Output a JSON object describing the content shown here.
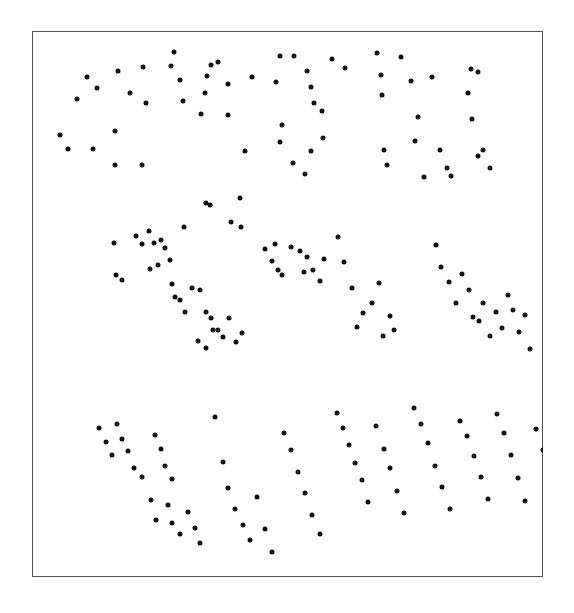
{
  "figure": {
    "background_color": "#ffffff",
    "frame": {
      "x": 32,
      "y": 31,
      "width": 511,
      "height": 546,
      "border_color": "#555555",
      "border_width": 1.5,
      "fill_color": "#ffffff"
    }
  },
  "chart_data": {
    "type": "scatter",
    "title": "",
    "subtitle": "",
    "xlabel": "",
    "ylabel": "",
    "grid": false,
    "legend": null,
    "axis_ticks": false,
    "tick_labels": [],
    "annotations": [],
    "xlim": [
      0,
      511
    ],
    "ylim": [
      0,
      546
    ],
    "y_axis_inverted": true,
    "marker": {
      "shape": "circle",
      "color": "#111111",
      "size_px": 5,
      "edge_color": "#111111"
    },
    "n_points": 192,
    "points": [
      [
        55,
        46
      ],
      [
        86,
        40
      ],
      [
        111,
        36
      ],
      [
        45,
        68
      ],
      [
        65,
        57
      ],
      [
        98,
        62
      ],
      [
        114,
        72
      ],
      [
        28,
        104
      ],
      [
        36,
        118
      ],
      [
        61,
        118
      ],
      [
        83,
        100
      ],
      [
        83,
        134
      ],
      [
        110,
        134
      ],
      [
        142,
        21
      ],
      [
        139,
        35
      ],
      [
        148,
        49
      ],
      [
        151,
        70
      ],
      [
        175,
        45
      ],
      [
        179,
        34
      ],
      [
        173,
        62
      ],
      [
        169,
        83
      ],
      [
        186,
        31
      ],
      [
        196,
        53
      ],
      [
        196,
        84
      ],
      [
        213,
        120
      ],
      [
        220,
        46
      ],
      [
        248,
        25
      ],
      [
        244,
        51
      ],
      [
        262,
        25
      ],
      [
        275,
        40
      ],
      [
        279,
        56
      ],
      [
        282,
        72
      ],
      [
        290,
        80
      ],
      [
        300,
        28
      ],
      [
        313,
        37
      ],
      [
        250,
        94
      ],
      [
        248,
        111
      ],
      [
        261,
        132
      ],
      [
        273,
        143
      ],
      [
        279,
        120
      ],
      [
        291,
        107
      ],
      [
        345,
        22
      ],
      [
        349,
        44
      ],
      [
        350,
        64
      ],
      [
        352,
        119
      ],
      [
        355,
        134
      ],
      [
        369,
        26
      ],
      [
        379,
        50
      ],
      [
        386,
        86
      ],
      [
        383,
        110
      ],
      [
        392,
        146
      ],
      [
        400,
        46
      ],
      [
        408,
        119
      ],
      [
        415,
        137
      ],
      [
        419,
        145
      ],
      [
        439,
        38
      ],
      [
        436,
        62
      ],
      [
        440,
        88
      ],
      [
        446,
        41
      ],
      [
        446,
        125
      ],
      [
        451,
        119
      ],
      [
        458,
        137
      ],
      [
        152,
        196
      ],
      [
        174,
        172
      ],
      [
        178,
        174
      ],
      [
        199,
        191
      ],
      [
        208,
        167
      ],
      [
        209,
        196
      ],
      [
        82,
        212
      ],
      [
        104,
        205
      ],
      [
        110,
        213
      ],
      [
        117,
        200
      ],
      [
        122,
        212
      ],
      [
        129,
        209
      ],
      [
        133,
        217
      ],
      [
        138,
        229
      ],
      [
        126,
        234
      ],
      [
        118,
        238
      ],
      [
        84,
        244
      ],
      [
        90,
        249
      ],
      [
        140,
        253
      ],
      [
        143,
        266
      ],
      [
        148,
        269
      ],
      [
        153,
        281
      ],
      [
        160,
        257
      ],
      [
        168,
        259
      ],
      [
        174,
        281
      ],
      [
        179,
        287
      ],
      [
        181,
        299
      ],
      [
        166,
        310
      ],
      [
        174,
        317
      ],
      [
        186,
        299
      ],
      [
        191,
        306
      ],
      [
        197,
        287
      ],
      [
        204,
        311
      ],
      [
        210,
        302
      ],
      [
        233,
        218
      ],
      [
        240,
        230
      ],
      [
        243,
        213
      ],
      [
        246,
        239
      ],
      [
        250,
        244
      ],
      [
        259,
        216
      ],
      [
        268,
        220
      ],
      [
        272,
        241
      ],
      [
        275,
        226
      ],
      [
        281,
        239
      ],
      [
        288,
        250
      ],
      [
        292,
        228
      ],
      [
        306,
        206
      ],
      [
        312,
        231
      ],
      [
        320,
        257
      ],
      [
        325,
        296
      ],
      [
        331,
        282
      ],
      [
        340,
        272
      ],
      [
        347,
        252
      ],
      [
        351,
        305
      ],
      [
        358,
        285
      ],
      [
        362,
        299
      ],
      [
        404,
        214
      ],
      [
        409,
        236
      ],
      [
        417,
        251
      ],
      [
        424,
        272
      ],
      [
        430,
        243
      ],
      [
        437,
        259
      ],
      [
        441,
        286
      ],
      [
        447,
        290
      ],
      [
        451,
        272
      ],
      [
        458,
        305
      ],
      [
        464,
        281
      ],
      [
        470,
        297
      ],
      [
        476,
        264
      ],
      [
        481,
        279
      ],
      [
        487,
        301
      ],
      [
        493,
        284
      ],
      [
        498,
        318
      ],
      [
        67,
        397
      ],
      [
        74,
        411
      ],
      [
        80,
        424
      ],
      [
        85,
        393
      ],
      [
        90,
        408
      ],
      [
        96,
        420
      ],
      [
        102,
        437
      ],
      [
        110,
        446
      ],
      [
        123,
        404
      ],
      [
        129,
        418
      ],
      [
        133,
        435
      ],
      [
        140,
        448
      ],
      [
        119,
        469
      ],
      [
        124,
        489
      ],
      [
        136,
        474
      ],
      [
        140,
        492
      ],
      [
        148,
        503
      ],
      [
        156,
        481
      ],
      [
        163,
        497
      ],
      [
        168,
        512
      ],
      [
        183,
        386
      ],
      [
        191,
        431
      ],
      [
        196,
        457
      ],
      [
        203,
        478
      ],
      [
        211,
        494
      ],
      [
        218,
        509
      ],
      [
        225,
        466
      ],
      [
        233,
        498
      ],
      [
        240,
        521
      ],
      [
        252,
        402
      ],
      [
        259,
        419
      ],
      [
        266,
        441
      ],
      [
        273,
        462
      ],
      [
        280,
        484
      ],
      [
        288,
        503
      ],
      [
        305,
        382
      ],
      [
        311,
        397
      ],
      [
        317,
        414
      ],
      [
        323,
        432
      ],
      [
        330,
        449
      ],
      [
        336,
        471
      ],
      [
        344,
        395
      ],
      [
        352,
        418
      ],
      [
        358,
        437
      ],
      [
        365,
        460
      ],
      [
        372,
        482
      ],
      [
        382,
        377
      ],
      [
        389,
        393
      ],
      [
        396,
        412
      ],
      [
        403,
        435
      ],
      [
        410,
        456
      ],
      [
        418,
        478
      ],
      [
        428,
        390
      ],
      [
        435,
        405
      ],
      [
        442,
        425
      ],
      [
        449,
        446
      ],
      [
        456,
        468
      ],
      [
        465,
        383
      ],
      [
        472,
        402
      ],
      [
        479,
        424
      ],
      [
        486,
        447
      ],
      [
        493,
        470
      ],
      [
        504,
        398
      ],
      [
        511,
        419
      ],
      [
        518,
        441
      ]
    ]
  }
}
